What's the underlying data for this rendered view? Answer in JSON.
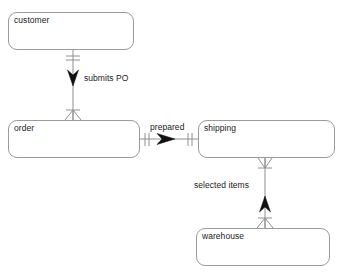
{
  "diagram": {
    "type": "entity-relationship-diagram",
    "notation": "crow's foot",
    "background_color": "#ffffff",
    "line_color": "#8f8f8f",
    "box_border_color": "#9a9a9a",
    "text_color": "#1a1a1a",
    "entities": [
      {
        "id": "customer",
        "label": "customer",
        "x": 8,
        "y": 12,
        "width": 126,
        "height": 38
      },
      {
        "id": "order",
        "label": "order",
        "x": 8,
        "y": 120,
        "width": 132,
        "height": 38
      },
      {
        "id": "shipping",
        "label": "shipping",
        "x": 198,
        "y": 120,
        "width": 137,
        "height": 38
      },
      {
        "id": "warehouse",
        "label": "warehouse",
        "x": 196,
        "y": 228,
        "width": 134,
        "height": 38
      }
    ],
    "relationships": [
      {
        "id": "submits-po",
        "label": "submits PO",
        "from": "customer",
        "to": "order",
        "from_cardinality": "one-and-only-one",
        "to_cardinality": "zero-or-many",
        "orientation": "vertical",
        "direction": "down",
        "label_x": 84,
        "label_y": 73
      },
      {
        "id": "prepared",
        "label": "prepared",
        "from": "order",
        "to": "shipping",
        "from_cardinality": "one-and-only-one",
        "to_cardinality": "one-and-only-one",
        "orientation": "horizontal",
        "direction": "right",
        "label_x": 150,
        "label_y": 122
      },
      {
        "id": "selected-items",
        "label": "selected items",
        "from": "warehouse",
        "to": "shipping",
        "from_cardinality": "zero-or-many",
        "to_cardinality": "zero-or-many",
        "orientation": "vertical",
        "direction": "up",
        "label_x": 194,
        "label_y": 180
      }
    ]
  }
}
